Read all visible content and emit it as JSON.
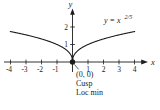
{
  "figure": {
    "axis_labels": {
      "x": "x",
      "y": "y"
    },
    "x_tick_labels": [
      "-4",
      "-3",
      "-2",
      "-1",
      "1",
      "2",
      "3",
      "4"
    ],
    "y_tick_labels": [
      "1",
      "2"
    ],
    "equation": {
      "base": "y = x",
      "exponent": "2/5"
    },
    "annotation": {
      "point": "(0, 0)",
      "feature": "Cusp",
      "extremum": "Loc min"
    },
    "colors": {
      "ink": "#1c1c1c",
      "background": "#ffffff"
    }
  },
  "chart_data": {
    "type": "line",
    "title": "",
    "function": "y = x^(2/5)",
    "exponent_numeric": 0.4,
    "x_range": [
      -4,
      4
    ],
    "x": [
      -4,
      -3,
      -2,
      -1,
      0,
      1,
      2,
      3,
      4
    ],
    "y": [
      1.74,
      1.55,
      1.32,
      1.0,
      0.0,
      1.0,
      1.32,
      1.55,
      1.74
    ],
    "xlabel": "x",
    "ylabel": "y",
    "x_ticks": [
      -4,
      -3,
      -2,
      -1,
      1,
      2,
      3,
      4
    ],
    "y_ticks": [
      1,
      2
    ],
    "xlim": [
      -4.4,
      5.0
    ],
    "ylim": [
      -0.6,
      3.0
    ],
    "grid": false,
    "legend": "none",
    "key_point": {
      "x": 0,
      "y": 0,
      "labels": [
        "(0, 0)",
        "Cusp",
        "Loc min"
      ]
    }
  }
}
